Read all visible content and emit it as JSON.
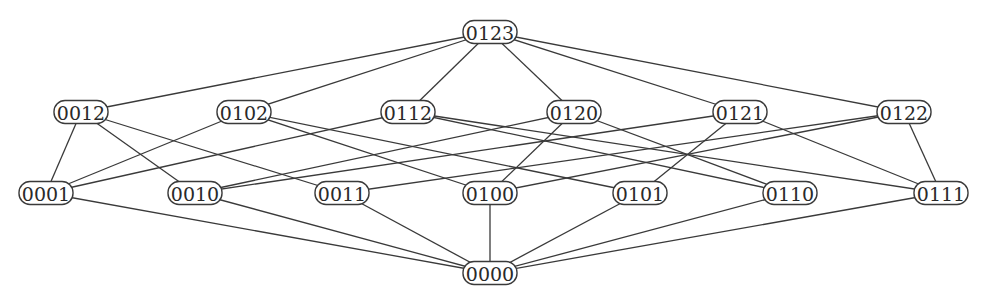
{
  "diagram": {
    "title": "",
    "node_style": {
      "width": 54,
      "height": 23,
      "radius": 11,
      "stroke": "#3a3a3a",
      "fill": "#ffffff"
    },
    "nodes": [
      {
        "id": "0123",
        "label": "0123",
        "x": 490,
        "y": 32,
        "rank": 0
      },
      {
        "id": "0012",
        "label": "0012",
        "x": 81,
        "y": 112,
        "rank": 1
      },
      {
        "id": "0102",
        "label": "0102",
        "x": 244,
        "y": 112,
        "rank": 1
      },
      {
        "id": "0112",
        "label": "0112",
        "x": 408,
        "y": 112,
        "rank": 1
      },
      {
        "id": "0120",
        "label": "0120",
        "x": 574,
        "y": 112,
        "rank": 1
      },
      {
        "id": "0121",
        "label": "0121",
        "x": 740,
        "y": 112,
        "rank": 1
      },
      {
        "id": "0122",
        "label": "0122",
        "x": 904,
        "y": 112,
        "rank": 1
      },
      {
        "id": "0001",
        "label": "0001",
        "x": 46,
        "y": 193,
        "rank": 2
      },
      {
        "id": "0010",
        "label": "0010",
        "x": 195,
        "y": 193,
        "rank": 2
      },
      {
        "id": "0011",
        "label": "0011",
        "x": 342,
        "y": 193,
        "rank": 2
      },
      {
        "id": "0100",
        "label": "0100",
        "x": 490,
        "y": 193,
        "rank": 2
      },
      {
        "id": "0101",
        "label": "0101",
        "x": 640,
        "y": 193,
        "rank": 2
      },
      {
        "id": "0110",
        "label": "0110",
        "x": 790,
        "y": 193,
        "rank": 2
      },
      {
        "id": "0111",
        "label": "0111",
        "x": 941,
        "y": 193,
        "rank": 2
      },
      {
        "id": "0000",
        "label": "0000",
        "x": 490,
        "y": 273,
        "rank": 3
      }
    ],
    "edges": [
      [
        "0123",
        "0012"
      ],
      [
        "0123",
        "0102"
      ],
      [
        "0123",
        "0112"
      ],
      [
        "0123",
        "0120"
      ],
      [
        "0123",
        "0121"
      ],
      [
        "0123",
        "0122"
      ],
      [
        "0012",
        "0001"
      ],
      [
        "0012",
        "0010"
      ],
      [
        "0012",
        "0011"
      ],
      [
        "0102",
        "0001"
      ],
      [
        "0102",
        "0100"
      ],
      [
        "0102",
        "0101"
      ],
      [
        "0112",
        "0001"
      ],
      [
        "0112",
        "0110"
      ],
      [
        "0112",
        "0111"
      ],
      [
        "0120",
        "0010"
      ],
      [
        "0120",
        "0100"
      ],
      [
        "0120",
        "0110"
      ],
      [
        "0121",
        "0010"
      ],
      [
        "0121",
        "0101"
      ],
      [
        "0121",
        "0111"
      ],
      [
        "0122",
        "0011"
      ],
      [
        "0122",
        "0100"
      ],
      [
        "0122",
        "0111"
      ],
      [
        "0001",
        "0000"
      ],
      [
        "0010",
        "0000"
      ],
      [
        "0011",
        "0000"
      ],
      [
        "0100",
        "0000"
      ],
      [
        "0101",
        "0000"
      ],
      [
        "0110",
        "0000"
      ],
      [
        "0111",
        "0000"
      ]
    ]
  }
}
